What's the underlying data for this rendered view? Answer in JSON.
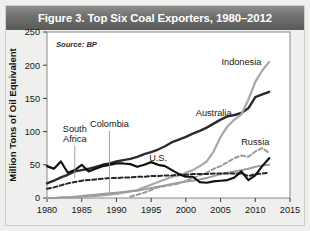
{
  "header": {
    "title": "Figure 3. Top Six Coal Exporters, 1980–2012",
    "background_color": "#6f6f6d",
    "text_color": "#ffffff"
  },
  "card": {
    "background_color": "#efefee",
    "border_color": "#cfcfcc"
  },
  "source_note": "Source: BP",
  "chart_data": {
    "type": "line",
    "title": "Figure 3. Top Six Coal Exporters, 1980–2012",
    "source": "Source: BP",
    "xlabel": "",
    "ylabel": "Million Tons of Oil Equivalent",
    "xlim": [
      1980,
      2015
    ],
    "ylim": [
      0,
      250
    ],
    "xticks": [
      1980,
      1985,
      1990,
      1995,
      2000,
      2005,
      2010,
      2015
    ],
    "yticks": [
      0,
      50,
      100,
      150,
      200,
      250
    ],
    "grid": false,
    "legend": "inline-labels",
    "plot_bg": "#ffffff",
    "frame_color": "#8a8a88",
    "x": [
      1980,
      1981,
      1982,
      1983,
      1984,
      1985,
      1986,
      1987,
      1988,
      1989,
      1990,
      1991,
      1992,
      1993,
      1994,
      1995,
      1996,
      1997,
      1998,
      1999,
      2000,
      2001,
      2002,
      2003,
      2004,
      2005,
      2006,
      2007,
      2008,
      2009,
      2010,
      2011,
      2012
    ],
    "series": [
      {
        "name": "Australia",
        "color": "#2b2b2b",
        "style": "solid",
        "width": 2.4,
        "label_x": 2004,
        "label_y": 124,
        "values": [
          22,
          26,
          31,
          35,
          40,
          42,
          44,
          47,
          50,
          52,
          55,
          57,
          59,
          62,
          66,
          69,
          73,
          78,
          84,
          88,
          92,
          97,
          101,
          106,
          112,
          118,
          123,
          125,
          128,
          135,
          152,
          156,
          160
        ]
      },
      {
        "name": "Indonesia",
        "color": "#a8a8a6",
        "style": "solid",
        "width": 2.2,
        "label_x": 2008,
        "label_y": 200,
        "values": [
          0,
          0,
          0,
          0,
          1,
          1,
          2,
          3,
          4,
          5,
          6,
          8,
          10,
          12,
          16,
          20,
          24,
          28,
          32,
          34,
          38,
          42,
          48,
          55,
          70,
          92,
          108,
          118,
          126,
          148,
          175,
          192,
          205
        ]
      },
      {
        "name": "Russia",
        "color": "#9a9a98",
        "style": "dashed",
        "width": 2.0,
        "label_x": 2010,
        "label_y": 80,
        "values": [
          null,
          null,
          null,
          null,
          null,
          null,
          null,
          null,
          null,
          null,
          null,
          null,
          2,
          5,
          8,
          12,
          16,
          18,
          20,
          22,
          26,
          30,
          34,
          38,
          44,
          48,
          54,
          60,
          64,
          62,
          70,
          75,
          68
        ]
      },
      {
        "name": "Colombia",
        "color": "#9c9c9a",
        "style": "solid",
        "width": 2.0,
        "label_x": 1989,
        "label_y": 107,
        "values": [
          0,
          0,
          1,
          1,
          2,
          3,
          4,
          5,
          6,
          7,
          8,
          9,
          10,
          11,
          13,
          15,
          17,
          19,
          21,
          23,
          25,
          26,
          28,
          30,
          33,
          36,
          38,
          40,
          42,
          44,
          47,
          49,
          50
        ]
      },
      {
        "name": "South Africa",
        "color": "#262626",
        "style": "dashed",
        "width": 2.0,
        "label_x": 1984,
        "label_y": 100,
        "values": [
          14,
          16,
          19,
          22,
          24,
          26,
          27,
          28,
          29,
          30,
          30,
          31,
          31,
          32,
          32,
          33,
          33,
          34,
          34,
          35,
          35,
          36,
          36,
          36,
          37,
          37,
          37,
          37,
          37,
          33,
          36,
          37,
          38
        ]
      },
      {
        "name": "U.S.",
        "color": "#111111",
        "style": "solid",
        "width": 2.2,
        "label_x": 1996,
        "label_y": 56,
        "values": [
          48,
          44,
          55,
          38,
          42,
          50,
          40,
          44,
          48,
          50,
          52,
          52,
          51,
          47,
          50,
          54,
          50,
          48,
          42,
          36,
          32,
          32,
          24,
          23,
          25,
          26,
          27,
          31,
          40,
          27,
          34,
          48,
          60
        ]
      }
    ]
  },
  "labels": {
    "yaxis_title": "Million Tons of Oil Equivalent",
    "ytick_texts": [
      "250",
      "200",
      "150",
      "100",
      "50",
      "0"
    ],
    "xtick_texts": [
      "1980",
      "1985",
      "1990",
      "1995",
      "2000",
      "2005",
      "2010",
      "2015"
    ],
    "series_names": [
      "Indonesia",
      "Australia",
      "Russia",
      "Colombia",
      "South Africa",
      "U.S."
    ],
    "south_africa_line1": "South",
    "south_africa_line2": "Africa"
  }
}
